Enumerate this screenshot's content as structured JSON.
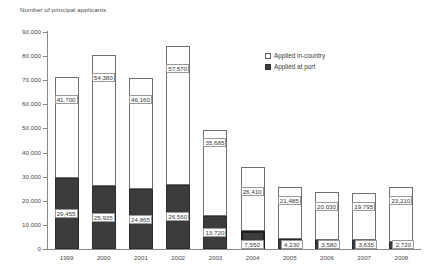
{
  "chart_data": {
    "type": "bar",
    "stacked": true,
    "title": "Number of principal applicants",
    "xlabel": "",
    "ylabel": "Number of principal applicants",
    "ylim": [
      0,
      90000
    ],
    "ytick_step": 10000,
    "grid": false,
    "legend_position": "top-right",
    "categories": [
      "1999",
      "2000",
      "2001",
      "2002",
      "2003",
      "2004",
      "2005",
      "2006",
      "2007",
      "2008"
    ],
    "yticks": [
      "0",
      "10,000",
      "20,000",
      "30,000",
      "40,000",
      "50,000",
      "60,000",
      "70,000",
      "80,000",
      "90,000"
    ],
    "series": [
      {
        "name": "Applied at port",
        "color": "#3c3c3c",
        "values": [
          29455,
          25935,
          24865,
          26560,
          13720,
          7550,
          4230,
          3580,
          3635,
          2720
        ],
        "labels": [
          "29,455",
          "25,935",
          "24,865",
          "26,560",
          "13,720",
          "7,550",
          "4,230",
          "3,580",
          "3,635",
          "2,720"
        ]
      },
      {
        "name": "Applied in-country",
        "color": "#ffffff",
        "values": [
          41700,
          54380,
          46160,
          57570,
          35685,
          26410,
          21485,
          20030,
          19795,
          23210
        ],
        "labels": [
          "41,700",
          "54,380",
          "46,160",
          "57,570",
          "35,685",
          "26,410",
          "21,485",
          "20,030",
          "19,795",
          "23,210"
        ]
      }
    ],
    "totals": [
      71155,
      80315,
      71025,
      84130,
      49405,
      33960,
      25715,
      23610,
      23430,
      25930
    ]
  },
  "legend": {
    "items": [
      {
        "label": "Applied in-country",
        "marker": "open-square-icon"
      },
      {
        "label": "Applied at port",
        "marker": "filled-square-icon"
      }
    ]
  }
}
